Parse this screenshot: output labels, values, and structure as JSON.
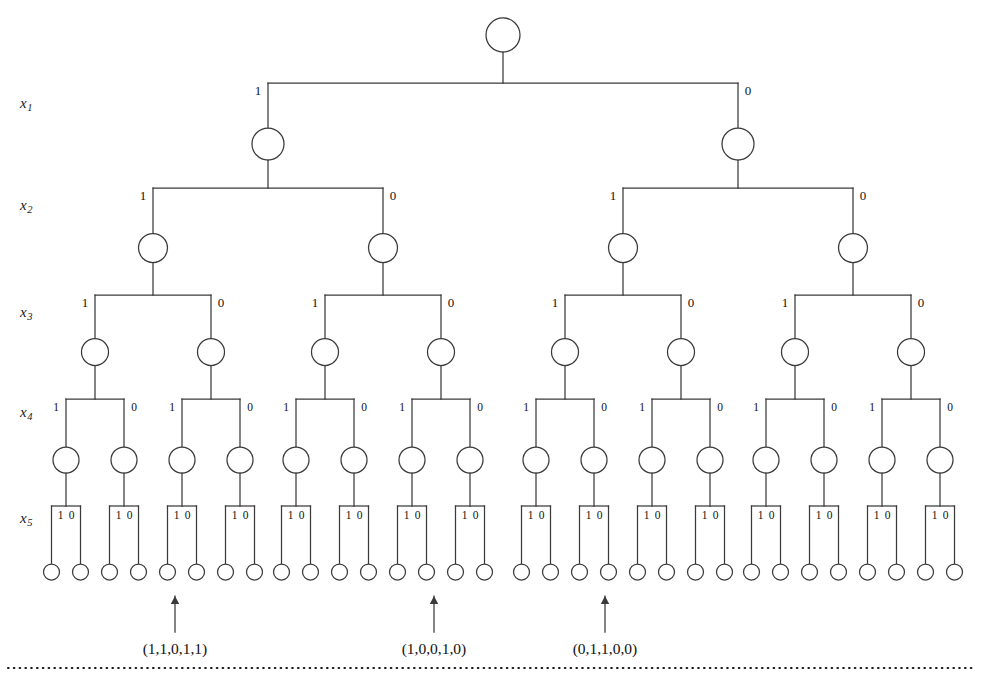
{
  "figure": {
    "type": "binary-decision-tree",
    "background": "#ffffff",
    "line_color": "#3a3a3a",
    "text_color": "#1a1a1a",
    "depth": 5,
    "leaf_count": 32
  },
  "level_labels": [
    {
      "name": "x1",
      "base": "x",
      "sub": "1",
      "y": 96
    },
    {
      "name": "x2",
      "base": "x",
      "sub": "2",
      "y": 198
    },
    {
      "name": "x3",
      "base": "x",
      "sub": "3",
      "y": 305
    },
    {
      "name": "x4",
      "base": "x",
      "sub": "4",
      "y": 405
    },
    {
      "name": "x5",
      "base": "x",
      "sub": "5",
      "y": 511
    }
  ],
  "branch_labels": {
    "left": "1",
    "right": "0"
  },
  "annotations": [
    {
      "label": "(1,1,0,1,1)",
      "leaf_index": 4,
      "x": 175
    },
    {
      "label": "(1,0,0,1,0)",
      "leaf_index": 13,
      "x": 434
    },
    {
      "label": "(0,1,1,0,0)",
      "leaf_index": 19,
      "x": 605
    }
  ],
  "geometry": {
    "root": {
      "x": 503,
      "y": 35,
      "r": 17
    },
    "levels": [
      {
        "level": 1,
        "bar_y": 83,
        "node_y": 144,
        "r": 16,
        "half_span": 235
      },
      {
        "level": 2,
        "bar_y": 188,
        "node_y": 248,
        "r": 14.5,
        "half_span": 115
      },
      {
        "level": 3,
        "bar_y": 295,
        "node_y": 352,
        "r": 13.5,
        "half_span": 58
      },
      {
        "level": 4,
        "bar_y": 399,
        "node_y": 460,
        "r": 13,
        "half_span": 29
      },
      {
        "level": 5,
        "bar_y": 506,
        "node_y": 572,
        "r": 8,
        "half_span": 14.5
      }
    ],
    "leaf_first_x": 58,
    "leaf_spacing": 28.97,
    "arrow": {
      "tip_y": 596,
      "tail_y": 632
    },
    "tuple_text_y": 641,
    "dotted_line": {
      "y": 668,
      "x_start": 8,
      "x_end": 974
    }
  }
}
